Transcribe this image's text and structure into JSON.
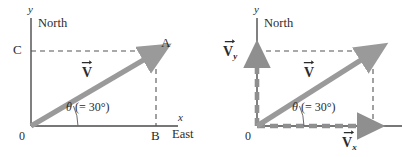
{
  "figure": {
    "colors": {
      "vector_gray": "#9a9a9a",
      "component_gray": "#8f8f8f",
      "axis_black": "#4a4a4a",
      "dashed_black": "#555555",
      "text": "#2b2b2b",
      "background": "#ffffff"
    }
  },
  "panels": [
    {
      "id": "left",
      "name": "vector-with-construction-lines",
      "axes": {
        "y_label": "y",
        "x_label": "x",
        "north_label": "North",
        "east_label": "East"
      },
      "origin_label": "0",
      "points": [
        {
          "name": "C",
          "label": "C",
          "position": "y-axis-intercept"
        },
        {
          "name": "A",
          "label": "A",
          "position": "vector-tip"
        },
        {
          "name": "B",
          "label": "B",
          "position": "x-axis-intercept"
        }
      ],
      "vector": {
        "symbol": "V",
        "subscript": "",
        "arrow_over": true
      },
      "angle": {
        "symbol": "θ",
        "value_text": "(= 30°)",
        "degrees": 30
      }
    },
    {
      "id": "right",
      "name": "vector-with-components",
      "axes": {
        "y_label": "y",
        "x_label": "",
        "north_label": "North",
        "east_label": ""
      },
      "origin_label": "0",
      "vector": {
        "symbol": "V",
        "subscript": "",
        "arrow_over": true
      },
      "components": [
        {
          "name": "y-component",
          "symbol": "V",
          "subscript": "y",
          "arrow_over": true,
          "direction": "up"
        },
        {
          "name": "x-component",
          "symbol": "V",
          "subscript": "x",
          "arrow_over": true,
          "direction": "right"
        }
      ],
      "angle": {
        "symbol": "θ",
        "value_text": "(= 30°)",
        "degrees": 30
      }
    }
  ]
}
